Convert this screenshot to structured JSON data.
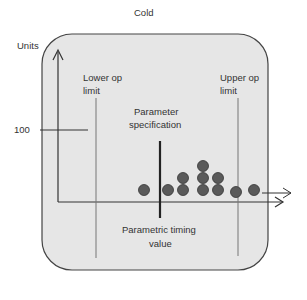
{
  "title": "Cold",
  "y_axis_label": "Units",
  "tick_label": "100",
  "lower_limit_label": "Lower op limit",
  "lower_limit_line1": "Lower op",
  "lower_limit_line2": "limit",
  "upper_limit_line1": "Upper op",
  "upper_limit_line2": "limit",
  "spec_line1": "Parameter",
  "spec_line2": "specification",
  "x_line1": "Parametric timing",
  "x_line2": "value",
  "colors": {
    "panel": "#e6e6e6",
    "border": "#444444",
    "dot": "#5a5a5a"
  },
  "dots": [
    {
      "x": 144,
      "y": 190
    },
    {
      "x": 168,
      "y": 190
    },
    {
      "x": 183,
      "y": 190
    },
    {
      "x": 183,
      "y": 178
    },
    {
      "x": 203,
      "y": 190
    },
    {
      "x": 203,
      "y": 178
    },
    {
      "x": 203,
      "y": 166
    },
    {
      "x": 218,
      "y": 190
    },
    {
      "x": 218,
      "y": 178
    },
    {
      "x": 236,
      "y": 192
    },
    {
      "x": 254,
      "y": 190
    }
  ]
}
